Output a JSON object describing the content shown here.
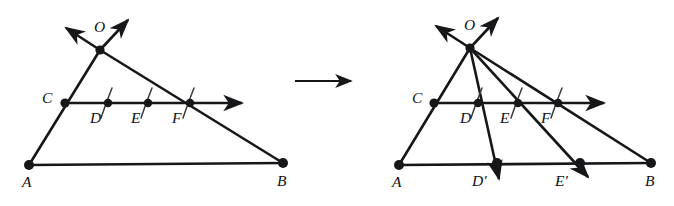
{
  "figure": {
    "type": "geometry-diagram",
    "stroke_color": "#17171a",
    "background_color": "#ffffff",
    "panels": [
      {
        "id": "left-panel",
        "name": "before-construction",
        "points": [
          {
            "id": "O",
            "label": "O",
            "x": 100,
            "y": 50,
            "label_x": 94,
            "label_y": 19,
            "dot": true,
            "dot_r": 4.6
          },
          {
            "id": "C",
            "label": "C",
            "x": 65,
            "y": 103,
            "label_x": 42,
            "label_y": 90,
            "dot": true,
            "dot_r": 4.6
          },
          {
            "id": "D",
            "label": "D",
            "x": 108,
            "y": 103,
            "label_x": 90,
            "label_y": 110,
            "dot": true,
            "dot_r": 4.2
          },
          {
            "id": "E",
            "label": "E",
            "x": 148,
            "y": 103,
            "label_x": 131,
            "label_y": 110,
            "dot": true,
            "dot_r": 4.2
          },
          {
            "id": "F",
            "label": "F",
            "x": 190,
            "y": 103,
            "label_x": 172,
            "label_y": 110,
            "dot": true,
            "dot_r": 4.2
          },
          {
            "id": "A",
            "label": "A",
            "x": 29,
            "y": 165,
            "label_x": 22,
            "label_y": 174,
            "dot": true,
            "dot_r": 5.0
          },
          {
            "id": "B",
            "label": "B",
            "x": 283,
            "y": 163,
            "label_x": 277,
            "label_y": 173,
            "dot": true,
            "dot_r": 5.0
          }
        ],
        "segments": [
          {
            "name": "side-OA-through-C",
            "from": "O",
            "to": "A"
          },
          {
            "name": "side-OB-through-F",
            "from": "O",
            "to": "B"
          },
          {
            "name": "base-AB",
            "from": "A",
            "to": "B"
          }
        ],
        "rays": [
          {
            "name": "ray-CDEF-right",
            "x1": 65,
            "y1": 103,
            "x2": 249,
            "y2": 103,
            "arrow": "end"
          },
          {
            "name": "ray-O-upleft",
            "x1": 100,
            "y1": 50,
            "x2": 62,
            "y2": 25,
            "arrow": "end"
          },
          {
            "name": "ray-O-upright",
            "x1": 100,
            "y1": 50,
            "x2": 131,
            "y2": 17,
            "arrow": "end"
          }
        ],
        "tick_marks": [
          {
            "name": "tick-CD",
            "cx": 108,
            "cy": 103
          },
          {
            "name": "tick-DE",
            "cx": 148,
            "cy": 103
          },
          {
            "name": "tick-EF",
            "cx": 190,
            "cy": 103
          }
        ]
      },
      {
        "id": "right-panel",
        "name": "after-construction",
        "points": [
          {
            "id": "O",
            "label": "O",
            "x": 470,
            "y": 48,
            "label_x": 464,
            "label_y": 17,
            "dot": true,
            "dot_r": 4.6
          },
          {
            "id": "C",
            "label": "C",
            "x": 434,
            "y": 103,
            "label_x": 412,
            "label_y": 90,
            "dot": true,
            "dot_r": 4.6
          },
          {
            "id": "D",
            "label": "D",
            "x": 478,
            "y": 103,
            "label_x": 460,
            "label_y": 110,
            "dot": true,
            "dot_r": 4.2
          },
          {
            "id": "E",
            "label": "E",
            "x": 518,
            "y": 103,
            "label_x": 500,
            "label_y": 110,
            "dot": true,
            "dot_r": 4.2
          },
          {
            "id": "F",
            "label": "F",
            "x": 558,
            "y": 103,
            "label_x": 541,
            "label_y": 110,
            "dot": true,
            "dot_r": 4.2
          },
          {
            "id": "A",
            "label": "A",
            "x": 399,
            "y": 165,
            "label_x": 392,
            "label_y": 174,
            "dot": true,
            "dot_r": 5.0
          },
          {
            "id": "Dp",
            "label": "D′",
            "x": 497,
            "y": 163,
            "label_x": 472,
            "label_y": 173,
            "dot": true,
            "dot_r": 5.0
          },
          {
            "id": "Ep",
            "label": "E′",
            "x": 580,
            "y": 163,
            "label_x": 555,
            "label_y": 173,
            "dot": true,
            "dot_r": 5.0
          },
          {
            "id": "B",
            "label": "B",
            "x": 651,
            "y": 163,
            "label_x": 645,
            "label_y": 173,
            "dot": true,
            "dot_r": 5.0
          }
        ],
        "segments": [
          {
            "name": "side-OA-through-C",
            "from": "O",
            "to": "A"
          },
          {
            "name": "side-OB-through-F",
            "from": "O",
            "to": "B"
          },
          {
            "name": "base-AB",
            "from": "A",
            "to": "B"
          }
        ],
        "rays": [
          {
            "name": "ray-CDEF-right",
            "x1": 434,
            "y1": 103,
            "x2": 611,
            "y2": 103,
            "arrow": "end"
          },
          {
            "name": "ray-O-upleft",
            "x1": 470,
            "y1": 48,
            "x2": 432,
            "y2": 23,
            "arrow": "end"
          },
          {
            "name": "ray-O-upright",
            "x1": 470,
            "y1": 48,
            "x2": 501,
            "y2": 15,
            "arrow": "end"
          },
          {
            "name": "ray-O-through-D",
            "x1": 470,
            "y1": 48,
            "x2": 501,
            "y2": 186,
            "arrow": "end"
          },
          {
            "name": "ray-O-through-E",
            "x1": 470,
            "y1": 48,
            "x2": 594,
            "y2": 183,
            "arrow": "end"
          }
        ],
        "tick_marks": [
          {
            "name": "tick-CD",
            "cx": 478,
            "cy": 103
          },
          {
            "name": "tick-DE",
            "cx": 518,
            "cy": 103
          },
          {
            "name": "tick-EF",
            "cx": 558,
            "cy": 103
          }
        ]
      }
    ],
    "transform_arrow": {
      "name": "transformation-arrow",
      "x1": 295,
      "y1": 81,
      "x2": 358,
      "y2": 81
    }
  }
}
